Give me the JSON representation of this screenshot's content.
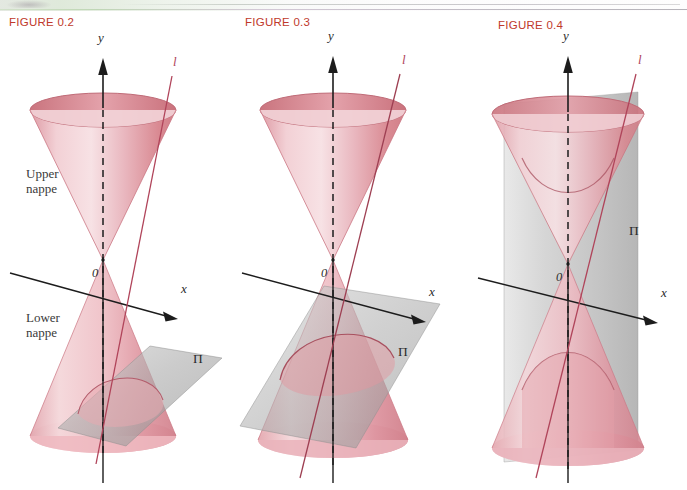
{
  "page": {
    "background": "#ffffff",
    "width": 687,
    "height": 490,
    "figure_label_color": "#c0392b",
    "cone_color": "#d98a96",
    "cone_color_light": "#f0c4ca",
    "plane_color": "#9a9a9a",
    "axis_color": "#1c1c1c",
    "line_color": "#b0445a"
  },
  "figures": [
    {
      "id": "figure-0-2",
      "label": "FIGURE 0.2",
      "description": "Double cone (two nappes) with axis y, axis x, line l and plane Pi cutting the lower nappe",
      "labels": {
        "upper_nappe": "Upper\nnappe",
        "upper_nappe_line1": "Upper",
        "upper_nappe_line2": "nappe",
        "lower_nappe_line1": "Lower",
        "lower_nappe_line2": "nappe",
        "origin": "0",
        "y_axis": "y",
        "x_axis": "x",
        "line": "l",
        "plane": "Π"
      }
    },
    {
      "id": "figure-0-3",
      "label": "FIGURE 0.3",
      "description": "Double cone with a tilted plane Pi intersecting the lower nappe in an ellipse",
      "labels": {
        "origin": "0",
        "y_axis": "y",
        "x_axis": "x",
        "line": "l",
        "plane": "Π"
      }
    },
    {
      "id": "figure-0-4",
      "label": "FIGURE 0.4",
      "description": "Double cone with a vertical plane Pi intersecting both nappes in a hyperbola",
      "labels": {
        "origin": "0",
        "y_axis": "y",
        "x_axis": "x",
        "line": "l",
        "plane": "Π"
      }
    }
  ]
}
